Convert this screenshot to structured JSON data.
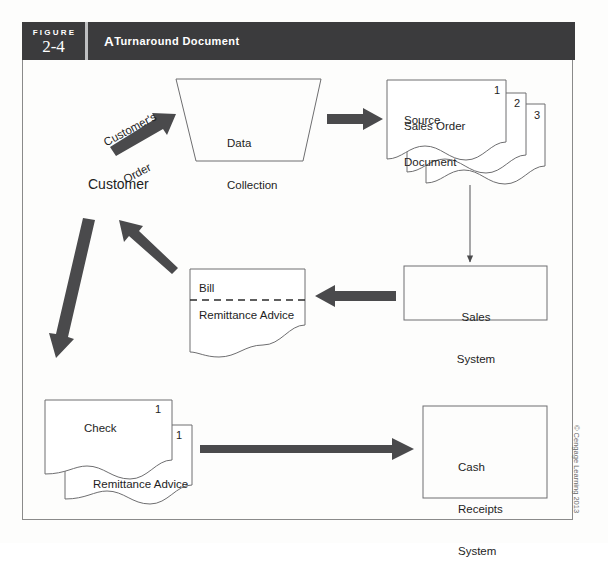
{
  "header": {
    "figure_word": "FIGURE",
    "figure_number": "2-4",
    "title": "A Turnaround Document",
    "title_first_letter": "A",
    "title_rest": " Turnaround Document",
    "bar_color": "#3b3b3d",
    "text_color": "#ffffff",
    "divider_color": "#bfc0c2"
  },
  "diagram": {
    "customer_order_line1": "Customer's",
    "customer_order_line2": "Order",
    "customer_label": "Customer",
    "data_collection_line1": "Data",
    "data_collection_line2": "Collection",
    "source_document_line1": "Source",
    "source_document_line2": "Document",
    "sales_order_label": "Sales Order",
    "copy_1": "1",
    "copy_2": "2",
    "copy_3": "3",
    "sales_system_line1": "Sales",
    "sales_system_line2": "System",
    "bill_label": "Bill",
    "remittance_advice_label": "Remittance Advice",
    "check_label": "Check",
    "check_copy_1": "1",
    "check_copy_2": "1",
    "check_remittance_label": "Remittance Advice",
    "cash_receipts_line1": "Cash",
    "cash_receipts_line2": "Receipts",
    "cash_receipts_line3": "System",
    "arrow_color": "#4a4a4c",
    "line_color": "#6e6e70",
    "text_color": "#1e1e1e"
  },
  "footer": {
    "copyright": "© Cengage Learning 2013"
  }
}
